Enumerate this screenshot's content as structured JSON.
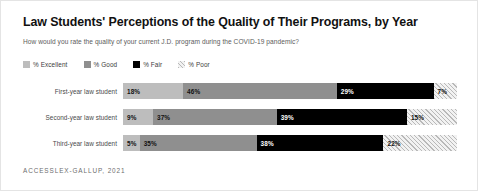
{
  "chart_data": {
    "type": "bar",
    "orientation": "horizontal",
    "stacked": true,
    "normalized_percent": true,
    "title": "Law Students' Perceptions of the Quality of Their Programs, by Year",
    "subtitle": "How would you rate the quality of your current J.D. program during the COVID-19 pandemic?",
    "xlabel": "",
    "ylabel": "",
    "xlim": [
      0,
      100
    ],
    "grid": false,
    "legend_position": "top-left",
    "categories": [
      "First-year law student",
      "Second-year law student",
      "Third-year law student"
    ],
    "series": [
      {
        "name": "% Excellent",
        "color": "#bdbdbd",
        "pattern": "solid",
        "values": [
          18,
          9,
          5
        ]
      },
      {
        "name": "% Good",
        "color": "#8f8f8f",
        "pattern": "solid",
        "values": [
          46,
          37,
          35
        ]
      },
      {
        "name": "% Fair",
        "color": "#000000",
        "pattern": "solid",
        "values": [
          29,
          39,
          38
        ]
      },
      {
        "name": "% Poor",
        "color": "#f2f2f2",
        "pattern": "diagonal-hatch",
        "values": [
          7,
          15,
          22
        ]
      }
    ],
    "value_labels": [
      [
        "18%",
        "46%",
        "29%",
        "7%"
      ],
      [
        "9%",
        "37%",
        "39%",
        "15%"
      ],
      [
        "5%",
        "35%",
        "38%",
        "22%"
      ]
    ],
    "source": "ACCESSLEX-GALLUP, 2021"
  },
  "legend": {
    "items": [
      {
        "label": "% Excellent",
        "swatch": "excellent"
      },
      {
        "label": "% Good",
        "swatch": "good"
      },
      {
        "label": "% Fair",
        "swatch": "fair"
      },
      {
        "label": "% Poor",
        "swatch": "poor"
      }
    ]
  }
}
